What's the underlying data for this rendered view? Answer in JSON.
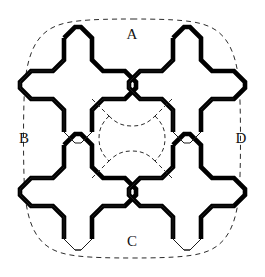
{
  "figure": {
    "type": "geometric-diagram",
    "canvas": {
      "width": 265,
      "height": 277,
      "background": "#ffffff"
    },
    "colors": {
      "ink": "#121212",
      "thick_edge": "#000000",
      "thin_edge": "#1a1a1a",
      "dashed_line": "#2b2b2b",
      "background": "#ffffff"
    },
    "labels": [
      {
        "id": "A",
        "text": "A",
        "x": 132,
        "y": 36,
        "position": "top"
      },
      {
        "id": "B",
        "text": "B",
        "x": 24,
        "y": 140,
        "position": "left"
      },
      {
        "id": "C",
        "text": "C",
        "x": 132,
        "y": 243,
        "position": "bottom"
      },
      {
        "id": "D",
        "text": "D",
        "x": 241,
        "y": 140,
        "position": "right"
      }
    ],
    "outer_boundary": {
      "name": "dashed-squircle-boundary",
      "style": "dashed",
      "stroke_width": 1,
      "dash_pattern": "5 4",
      "path": "M 132 19 C 178 19 196 21 208 26 C 228 34 236 54 239 82 C 241 104 241 173 239 195 C 236 223 228 243 208 251 C 196 256 178 258 132 258 C 86 258 68 256 56 251 C 36 243 28 223 25 195 C 23 173 23 104 25 82 C 28 54 36 34 56 26 C 68 21 86 19 132 19 Z"
    },
    "center_void": {
      "name": "central-octagon-void",
      "style": "dashed",
      "stroke_width": 1,
      "dash_pattern": "4 3",
      "description": "octagonal opening at the centre of the cell bounded by dashed arcs"
    },
    "crosses": [
      {
        "id": "cross-top-left",
        "name": "cross-top-left",
        "center": {
          "x": 78,
          "y": 85
        },
        "arm_length": 47,
        "arm_half_width": 14,
        "chamfer": 11,
        "thick_edges": "north-east facing",
        "thin_edges": "south-west facing",
        "diagonal_dash_count": 3,
        "diagonal_orientation": "NW-SE"
      },
      {
        "id": "cross-top-right",
        "name": "cross-top-right",
        "center": {
          "x": 187,
          "y": 85
        },
        "arm_length": 47,
        "arm_half_width": 14,
        "chamfer": 11,
        "thick_edges": "north-east facing",
        "thin_edges": "south-west facing",
        "diagonal_dash_count": 3,
        "diagonal_orientation": "NW-SE"
      },
      {
        "id": "cross-bottom-left",
        "name": "cross-bottom-left",
        "center": {
          "x": 78,
          "y": 192
        },
        "arm_length": 47,
        "arm_half_width": 14,
        "chamfer": 11,
        "thick_edges": "north-east facing",
        "thin_edges": "south-west facing",
        "diagonal_dash_count": 3,
        "diagonal_orientation": "NW-SE"
      },
      {
        "id": "cross-bottom-right",
        "name": "cross-bottom-right",
        "center": {
          "x": 187,
          "y": 192
        },
        "arm_length": 47,
        "arm_half_width": 14,
        "chamfer": 11,
        "thick_edges": "north-east facing",
        "thin_edges": "south-west facing",
        "diagonal_dash_count": 3,
        "diagonal_orientation": "NW-SE"
      }
    ],
    "stroke_widths": {
      "thick": 4.6,
      "thin": 1.0,
      "dashed": 1.0
    }
  }
}
